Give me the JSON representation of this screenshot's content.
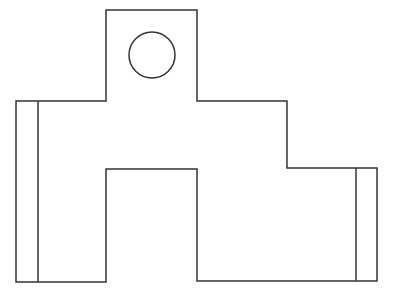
{
  "diagram": {
    "type": "technical-line-drawing",
    "canvas": {
      "width": 395,
      "height": 300,
      "background": "#ffffff"
    },
    "stroke": {
      "color": "#333333",
      "width": 1.5
    },
    "outline_points": "16,101 106,101 106,10 197,10 197,101 287,101 287,168 377,168 377,281 197,281 197,169 106,169 106,282 16,282",
    "hole": {
      "cx": 152,
      "cy": 55,
      "r": 23
    },
    "inner_lines": [
      {
        "name": "left-flange-edge",
        "x1": 38,
        "y1": 101,
        "x2": 38,
        "y2": 282
      },
      {
        "name": "right-flange-edge",
        "x1": 356,
        "y1": 168,
        "x2": 356,
        "y2": 281
      }
    ]
  }
}
